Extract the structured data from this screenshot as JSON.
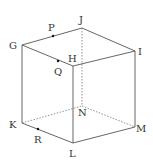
{
  "figure": {
    "type": "cube",
    "vertices": {
      "G": {
        "label": "G",
        "x": 22,
        "y": 45,
        "lx": 9,
        "ly": 49
      },
      "J": {
        "label": "J",
        "x": 82,
        "y": 28,
        "lx": 79,
        "ly": 23
      },
      "I": {
        "label": "I",
        "x": 135,
        "y": 51,
        "lx": 138,
        "ly": 55
      },
      "H": {
        "label": "H",
        "x": 73,
        "y": 66,
        "lx": 68,
        "ly": 62
      },
      "K": {
        "label": "K",
        "x": 22,
        "y": 123,
        "lx": 9,
        "ly": 128
      },
      "N": {
        "label": "N",
        "x": 82,
        "y": 106,
        "lx": 78,
        "ly": 116
      },
      "M": {
        "label": "M",
        "x": 135,
        "y": 127,
        "lx": 136,
        "ly": 132
      },
      "L": {
        "label": "L",
        "x": 73,
        "y": 143,
        "lx": 69,
        "ly": 157
      }
    },
    "points": {
      "P": {
        "label": "P",
        "x": 53,
        "y": 36,
        "lx": 48,
        "ly": 31
      },
      "Q": {
        "label": "Q",
        "x": 58,
        "y": 61,
        "lx": 54,
        "ly": 75
      },
      "R": {
        "label": "R",
        "x": 38,
        "y": 129,
        "lx": 34,
        "ly": 143
      }
    },
    "visible_edges": [
      "GJ",
      "JI",
      "IH",
      "HG",
      "GK",
      "HL",
      "IM",
      "KL",
      "LM"
    ],
    "hidden_edges": [
      "JN",
      "KN",
      "NM"
    ]
  }
}
